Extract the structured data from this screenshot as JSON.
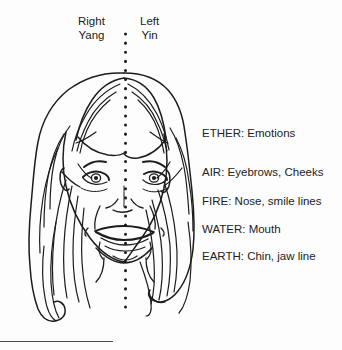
{
  "figure": {
    "name": "face-yin-yang-five-elements-diagram",
    "background_color": "#fdfdfd",
    "ink_color": "#1c1c1c",
    "centerline": {
      "style": "dotted",
      "orientation": "vertical",
      "x": 125,
      "y_start": 33,
      "y_end": 312,
      "dot_spacing": 9,
      "dot_size": 3
    },
    "side_labels": {
      "left": {
        "line1": "Right",
        "line2": "Yang"
      },
      "right": {
        "line1": "Left",
        "line2": "Yin"
      }
    },
    "element_labels": [
      "ETHER: Emotions",
      "AIR: Eyebrows, Cheeks",
      "FIRE: Nose, smile lines",
      "WATER: Mouth",
      "EARTH: Chin, jaw line"
    ]
  }
}
